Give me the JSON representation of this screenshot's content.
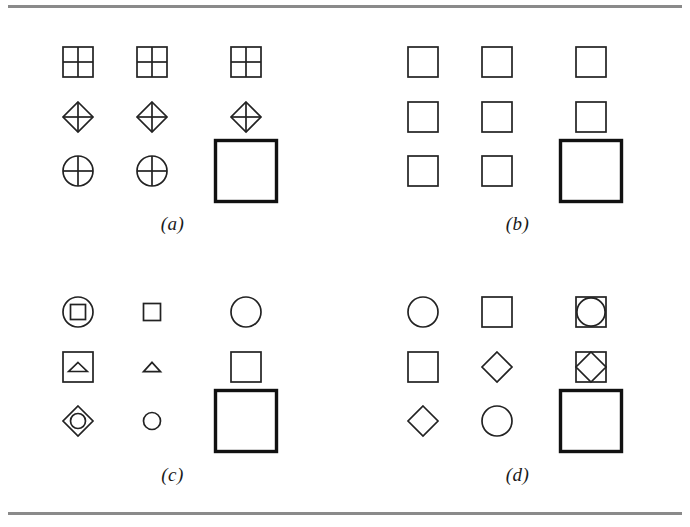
{
  "figure": {
    "kind": "line-art-diagram",
    "background_color": "#ffffff",
    "stroke_color": "#222222",
    "rule_color": "#8a8a8a",
    "rules": [
      {
        "name": "top-rule"
      },
      {
        "name": "bottom-rule"
      }
    ]
  },
  "panels": [
    {
      "id": "a",
      "label": "(a)",
      "rows": [
        {
          "cells": [
            {
              "shape": "square-quartered",
              "size": "small",
              "weight": "normal"
            },
            {
              "shape": "square-quartered",
              "size": "small",
              "weight": "normal"
            },
            {
              "shape": "square-quartered",
              "size": "small",
              "weight": "normal"
            }
          ]
        },
        {
          "cells": [
            {
              "shape": "diamond-crossed",
              "size": "small",
              "weight": "normal"
            },
            {
              "shape": "diamond-crossed",
              "size": "small",
              "weight": "normal"
            },
            {
              "shape": "diamond-crossed",
              "size": "small",
              "weight": "normal"
            }
          ]
        },
        {
          "cells": [
            {
              "shape": "circle-crossed",
              "size": "small",
              "weight": "normal"
            },
            {
              "shape": "circle-crossed",
              "size": "small",
              "weight": "normal"
            },
            {
              "shape": "square",
              "size": "large",
              "weight": "bold"
            }
          ]
        }
      ]
    },
    {
      "id": "b",
      "label": "(b)",
      "rows": [
        {
          "cells": [
            {
              "shape": "square",
              "size": "small",
              "weight": "normal"
            },
            {
              "shape": "square",
              "size": "small",
              "weight": "normal"
            },
            {
              "shape": "square",
              "size": "small",
              "weight": "normal"
            }
          ]
        },
        {
          "cells": [
            {
              "shape": "square",
              "size": "small",
              "weight": "normal"
            },
            {
              "shape": "square",
              "size": "small",
              "weight": "normal"
            },
            {
              "shape": "square",
              "size": "small",
              "weight": "normal"
            }
          ]
        },
        {
          "cells": [
            {
              "shape": "square",
              "size": "small",
              "weight": "normal"
            },
            {
              "shape": "square",
              "size": "small",
              "weight": "normal"
            },
            {
              "shape": "square",
              "size": "large",
              "weight": "bold"
            }
          ]
        }
      ]
    },
    {
      "id": "c",
      "label": "(c)",
      "rows": [
        {
          "cells": [
            {
              "shape": "circle-containing-square",
              "size": "small",
              "weight": "normal"
            },
            {
              "shape": "square",
              "size": "tiny",
              "weight": "normal"
            },
            {
              "shape": "circle",
              "size": "small",
              "weight": "normal"
            }
          ]
        },
        {
          "cells": [
            {
              "shape": "square-containing-triangle",
              "size": "small",
              "weight": "normal"
            },
            {
              "shape": "triangle-flat",
              "size": "tiny",
              "weight": "normal"
            },
            {
              "shape": "square",
              "size": "small",
              "weight": "normal"
            }
          ]
        },
        {
          "cells": [
            {
              "shape": "diamond-containing-circle",
              "size": "small",
              "weight": "normal"
            },
            {
              "shape": "circle",
              "size": "tiny",
              "weight": "normal"
            },
            {
              "shape": "square",
              "size": "large",
              "weight": "bold"
            }
          ]
        }
      ]
    },
    {
      "id": "d",
      "label": "(d)",
      "rows": [
        {
          "cells": [
            {
              "shape": "circle",
              "size": "small",
              "weight": "normal"
            },
            {
              "shape": "square",
              "size": "small",
              "weight": "normal"
            },
            {
              "shape": "square-containing-circle",
              "size": "small",
              "weight": "normal"
            }
          ]
        },
        {
          "cells": [
            {
              "shape": "square",
              "size": "small",
              "weight": "normal"
            },
            {
              "shape": "diamond",
              "size": "small",
              "weight": "normal"
            },
            {
              "shape": "square-containing-diamond",
              "size": "small",
              "weight": "normal"
            }
          ]
        },
        {
          "cells": [
            {
              "shape": "diamond",
              "size": "small",
              "weight": "normal"
            },
            {
              "shape": "circle",
              "size": "small",
              "weight": "normal"
            },
            {
              "shape": "square",
              "size": "large",
              "weight": "bold"
            }
          ]
        }
      ]
    }
  ]
}
